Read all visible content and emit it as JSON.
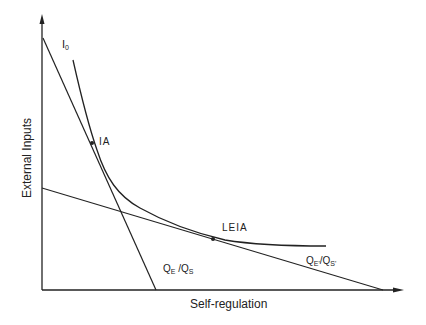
{
  "diagram": {
    "axes": {
      "x_label": "Self-regulation",
      "y_label": "External Inputs"
    },
    "curve": {
      "label_main": "I",
      "label_sub": "0"
    },
    "points": [
      {
        "label": "IA"
      },
      {
        "label": "LEIA"
      }
    ],
    "lines": [
      {
        "label_q1": "Q",
        "label_q1_sub": "E",
        "label_sep": " /",
        "label_q2": "Q",
        "label_q2_sub": "S"
      },
      {
        "label_q1": "Q",
        "label_q1_sub": "E'",
        "label_sep": "/",
        "label_q2": "Q",
        "label_q2_sub": "S'"
      }
    ],
    "colors": {
      "line": "#222222",
      "background": "#ffffff"
    }
  }
}
